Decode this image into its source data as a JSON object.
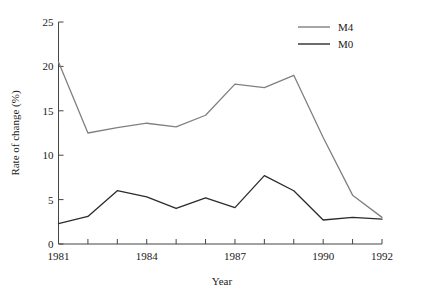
{
  "chart_data": {
    "type": "line",
    "title": "",
    "xlabel": "Year",
    "ylabel": "Rate of change (%)",
    "x": [
      1981,
      1982,
      1983,
      1984,
      1985,
      1986,
      1987,
      1988,
      1989,
      1990,
      1991,
      1992
    ],
    "xlim": [
      1981,
      1992
    ],
    "ylim": [
      0,
      25
    ],
    "grid": false,
    "legend_position": "top-right",
    "xticks": [
      1981,
      1982,
      1983,
      1984,
      1985,
      1986,
      1987,
      1988,
      1989,
      1990,
      1991,
      1992
    ],
    "xtick_labels": [
      "1981",
      "",
      "",
      "1984",
      "",
      "",
      "1987",
      "",
      "",
      "1990",
      "",
      "1992"
    ],
    "yticks": [
      0,
      5,
      10,
      15,
      20,
      25
    ],
    "ytick_labels": [
      "0",
      "5",
      "10",
      "15",
      "20",
      "25"
    ],
    "series": [
      {
        "name": "M4",
        "color": "#808080",
        "values": [
          20.5,
          12.5,
          13.1,
          13.6,
          13.2,
          14.5,
          18.0,
          17.6,
          19.0,
          12.0,
          5.5,
          3.0
        ]
      },
      {
        "name": "M0",
        "color": "#2b2b2b",
        "values": [
          2.3,
          3.1,
          6.0,
          5.3,
          4.0,
          5.2,
          4.1,
          7.7,
          6.0,
          2.7,
          3.0,
          2.8
        ]
      }
    ]
  },
  "legend": {
    "entries": [
      {
        "label": "M4"
      },
      {
        "label": "M0"
      }
    ]
  },
  "axes": {
    "y_title": "Rate of change (%)",
    "x_title": "Year"
  }
}
